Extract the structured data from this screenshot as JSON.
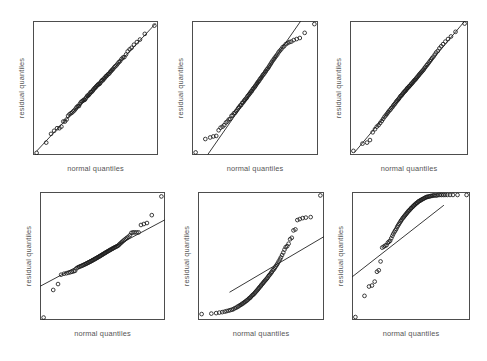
{
  "figure": {
    "width": 487,
    "height": 361,
    "background": "#ffffff",
    "layout": {
      "rows": 2,
      "cols": 3
    },
    "marker_color": "#1c1c1c",
    "line_color": "#222222",
    "frame_color": "#4d4d4d",
    "label_color": "#555555"
  },
  "chart_data": [
    {
      "type": "scatter",
      "panel_index": 1,
      "panel_label": "top-left",
      "title": "",
      "xlabel": "normal quantiles",
      "ylabel": "residual quantiles",
      "grid": false,
      "legend": "none",
      "xlim": [
        -2.6,
        2.6
      ],
      "ylim": [
        -2.6,
        2.6
      ],
      "reference_line": {
        "slope": 1.0,
        "intercept": 0.0,
        "x_from": -2.45,
        "x_to": 2.5,
        "description": "straight diagonal reference line from lower-left to upper-right"
      },
      "annotation": "well-behaved normal Q-Q plot: points follow the reference line closely",
      "x": [
        -2.45,
        -2.05,
        -1.85,
        -1.72,
        -1.6,
        -1.5,
        -1.42,
        -1.34,
        -1.27,
        -1.2,
        -1.14,
        -1.08,
        -1.02,
        -0.97,
        -0.92,
        -0.87,
        -0.82,
        -0.78,
        -0.73,
        -0.69,
        -0.65,
        -0.61,
        -0.57,
        -0.53,
        -0.49,
        -0.45,
        -0.42,
        -0.38,
        -0.34,
        -0.31,
        -0.27,
        -0.24,
        -0.2,
        -0.17,
        -0.13,
        -0.1,
        -0.07,
        -0.03,
        0.0,
        0.03,
        0.07,
        0.1,
        0.13,
        0.17,
        0.2,
        0.24,
        0.27,
        0.31,
        0.34,
        0.38,
        0.42,
        0.45,
        0.49,
        0.53,
        0.57,
        0.61,
        0.65,
        0.69,
        0.73,
        0.78,
        0.82,
        0.87,
        0.92,
        0.97,
        1.02,
        1.08,
        1.14,
        1.2,
        1.27,
        1.34,
        1.42,
        1.5,
        1.6,
        1.72,
        1.85,
        2.05,
        2.45
      ],
      "y": [
        -2.52,
        -2.12,
        -1.78,
        -1.66,
        -1.56,
        -1.56,
        -1.5,
        -1.3,
        -1.3,
        -1.22,
        -1.08,
        -1.02,
        -0.98,
        -0.95,
        -0.9,
        -0.86,
        -0.8,
        -0.74,
        -0.7,
        -0.7,
        -0.62,
        -0.56,
        -0.52,
        -0.5,
        -0.46,
        -0.46,
        -0.42,
        -0.36,
        -0.3,
        -0.3,
        -0.26,
        -0.22,
        -0.16,
        -0.16,
        -0.12,
        -0.08,
        -0.04,
        0.0,
        0.02,
        0.06,
        0.1,
        0.12,
        0.16,
        0.16,
        0.2,
        0.26,
        0.3,
        0.3,
        0.36,
        0.38,
        0.44,
        0.46,
        0.5,
        0.54,
        0.56,
        0.62,
        0.66,
        0.7,
        0.74,
        0.8,
        0.84,
        0.88,
        0.94,
        1.0,
        1.04,
        1.12,
        1.18,
        1.2,
        1.3,
        1.42,
        1.5,
        1.56,
        1.68,
        1.78,
        1.88,
        2.1,
        2.42
      ]
    },
    {
      "type": "scatter",
      "panel_index": 2,
      "panel_label": "top-middle",
      "title": "",
      "xlabel": "normal quantiles",
      "ylabel": "residual quantiles",
      "grid": false,
      "legend": "none",
      "xlim": [
        -2.6,
        2.6
      ],
      "ylim": [
        -2.6,
        2.6
      ],
      "reference_line": {
        "slope": 1.35,
        "intercept": 0.05,
        "x_from": -1.95,
        "x_to": 1.9,
        "description": "steeper reference line exiting through the top edge of the frame"
      },
      "annotation": "approximately normal; the steeper reference line leaves the panel at the top",
      "x": [
        -2.45,
        -2.05,
        -1.85,
        -1.72,
        -1.6,
        -1.5,
        -1.42,
        -1.34,
        -1.27,
        -1.2,
        -1.14,
        -1.08,
        -1.02,
        -0.97,
        -0.92,
        -0.87,
        -0.82,
        -0.78,
        -0.73,
        -0.69,
        -0.65,
        -0.61,
        -0.57,
        -0.53,
        -0.49,
        -0.45,
        -0.42,
        -0.38,
        -0.34,
        -0.31,
        -0.27,
        -0.24,
        -0.2,
        -0.17,
        -0.13,
        -0.1,
        -0.07,
        -0.03,
        0.0,
        0.03,
        0.07,
        0.1,
        0.13,
        0.17,
        0.2,
        0.24,
        0.27,
        0.31,
        0.34,
        0.38,
        0.42,
        0.45,
        0.49,
        0.53,
        0.57,
        0.61,
        0.65,
        0.69,
        0.73,
        0.78,
        0.82,
        0.87,
        0.92,
        0.97,
        1.02,
        1.08,
        1.14,
        1.2,
        1.27,
        1.34,
        1.42,
        1.5,
        1.6,
        1.72,
        1.85,
        2.05,
        2.45
      ],
      "y": [
        -2.5,
        -1.98,
        -1.92,
        -1.88,
        -1.86,
        -1.64,
        -1.54,
        -1.5,
        -1.44,
        -1.34,
        -1.3,
        -1.22,
        -1.2,
        -1.08,
        -1.06,
        -0.98,
        -0.96,
        -0.9,
        -0.84,
        -0.78,
        -0.74,
        -0.68,
        -0.66,
        -0.58,
        -0.56,
        -0.5,
        -0.46,
        -0.42,
        -0.38,
        -0.32,
        -0.28,
        -0.24,
        -0.2,
        -0.14,
        -0.12,
        -0.06,
        -0.02,
        0.02,
        0.06,
        0.1,
        0.16,
        0.2,
        0.24,
        0.28,
        0.34,
        0.38,
        0.42,
        0.48,
        0.52,
        0.56,
        0.62,
        0.66,
        0.72,
        0.76,
        0.82,
        0.88,
        0.94,
        1.0,
        1.06,
        1.12,
        1.18,
        1.24,
        1.3,
        1.38,
        1.44,
        1.5,
        1.58,
        1.62,
        1.7,
        1.74,
        1.78,
        1.8,
        1.86,
        1.9,
        1.94,
        2.14,
        2.48
      ]
    },
    {
      "type": "scatter",
      "panel_index": 3,
      "panel_label": "top-right",
      "title": "",
      "xlabel": "normal quantiles",
      "ylabel": "residual quantiles",
      "grid": false,
      "legend": "none",
      "xlim": [
        -2.6,
        2.6
      ],
      "ylim": [
        -2.6,
        2.6
      ],
      "reference_line": {
        "slope": 1.05,
        "intercept": 0.02,
        "x_from": -2.4,
        "x_to": 2.45,
        "description": "straight diagonal reference line from lower-left to upper-right"
      },
      "annotation": "well-behaved normal Q-Q plot: points follow the reference line closely",
      "x": [
        -2.45,
        -2.05,
        -1.85,
        -1.72,
        -1.6,
        -1.5,
        -1.42,
        -1.34,
        -1.27,
        -1.2,
        -1.14,
        -1.08,
        -1.02,
        -0.97,
        -0.92,
        -0.87,
        -0.82,
        -0.78,
        -0.73,
        -0.69,
        -0.65,
        -0.61,
        -0.57,
        -0.53,
        -0.49,
        -0.45,
        -0.42,
        -0.38,
        -0.34,
        -0.31,
        -0.27,
        -0.24,
        -0.2,
        -0.17,
        -0.13,
        -0.1,
        -0.07,
        -0.03,
        0.0,
        0.03,
        0.07,
        0.1,
        0.13,
        0.17,
        0.2,
        0.24,
        0.27,
        0.31,
        0.34,
        0.38,
        0.42,
        0.45,
        0.49,
        0.53,
        0.57,
        0.61,
        0.65,
        0.69,
        0.73,
        0.78,
        0.82,
        0.87,
        0.92,
        0.97,
        1.02,
        1.08,
        1.14,
        1.2,
        1.27,
        1.34,
        1.42,
        1.5,
        1.6,
        1.72,
        1.85,
        2.05,
        2.45
      ],
      "y": [
        -2.44,
        -2.16,
        -2.12,
        -2.02,
        -1.72,
        -1.6,
        -1.5,
        -1.44,
        -1.36,
        -1.28,
        -1.2,
        -1.12,
        -1.06,
        -1.0,
        -0.94,
        -0.88,
        -0.84,
        -0.78,
        -0.74,
        -0.68,
        -0.64,
        -0.6,
        -0.54,
        -0.5,
        -0.46,
        -0.42,
        -0.38,
        -0.32,
        -0.3,
        -0.26,
        -0.22,
        -0.18,
        -0.14,
        -0.12,
        -0.08,
        -0.04,
        0.0,
        0.02,
        0.06,
        0.08,
        0.12,
        0.16,
        0.18,
        0.22,
        0.26,
        0.3,
        0.32,
        0.36,
        0.4,
        0.44,
        0.48,
        0.52,
        0.56,
        0.6,
        0.64,
        0.68,
        0.72,
        0.78,
        0.82,
        0.88,
        0.92,
        0.98,
        1.04,
        1.1,
        1.16,
        1.22,
        1.3,
        1.38,
        1.44,
        1.54,
        1.62,
        1.7,
        1.8,
        1.9,
        2.0,
        2.18,
        2.5
      ]
    },
    {
      "type": "scatter",
      "panel_index": 4,
      "panel_label": "bottom-left",
      "title": "",
      "xlabel": "normal quantiles",
      "ylabel": "residual quantiles",
      "grid": false,
      "legend": "none",
      "xlim": [
        -2.6,
        2.6
      ],
      "ylim": [
        -2.6,
        2.6
      ],
      "reference_line": {
        "slope": 0.52,
        "intercept": 0.12,
        "x_from": -2.6,
        "x_to": 2.6,
        "description": "shallow reference line crossing the left and right frame edges"
      },
      "annotation": "heavy-tailed / outlier pattern: extreme points fall far from the shallow reference line at both ends",
      "x": [
        -2.45,
        -2.05,
        -1.85,
        -1.72,
        -1.6,
        -1.5,
        -1.42,
        -1.34,
        -1.27,
        -1.2,
        -1.14,
        -1.08,
        -1.02,
        -0.97,
        -0.92,
        -0.87,
        -0.82,
        -0.78,
        -0.73,
        -0.69,
        -0.65,
        -0.61,
        -0.57,
        -0.53,
        -0.49,
        -0.45,
        -0.42,
        -0.38,
        -0.34,
        -0.31,
        -0.27,
        -0.24,
        -0.2,
        -0.17,
        -0.13,
        -0.1,
        -0.07,
        -0.03,
        0.0,
        0.03,
        0.07,
        0.1,
        0.13,
        0.17,
        0.2,
        0.24,
        0.27,
        0.31,
        0.34,
        0.38,
        0.42,
        0.45,
        0.49,
        0.53,
        0.57,
        0.61,
        0.65,
        0.69,
        0.73,
        0.78,
        0.82,
        0.87,
        0.92,
        0.97,
        1.02,
        1.08,
        1.14,
        1.2,
        1.27,
        1.34,
        1.42,
        1.5,
        1.6,
        1.72,
        1.85,
        2.05,
        2.45
      ],
      "y": [
        -2.5,
        -1.38,
        -1.14,
        -0.76,
        -0.72,
        -0.7,
        -0.68,
        -0.66,
        -0.64,
        -0.62,
        -0.6,
        -0.5,
        -0.46,
        -0.44,
        -0.42,
        -0.4,
        -0.38,
        -0.36,
        -0.34,
        -0.32,
        -0.3,
        -0.28,
        -0.26,
        -0.24,
        -0.22,
        -0.2,
        -0.18,
        -0.16,
        -0.14,
        -0.12,
        -0.1,
        -0.08,
        -0.06,
        -0.04,
        -0.02,
        0.0,
        0.02,
        0.04,
        0.06,
        0.08,
        0.1,
        0.12,
        0.14,
        0.16,
        0.18,
        0.2,
        0.22,
        0.24,
        0.26,
        0.28,
        0.3,
        0.32,
        0.34,
        0.36,
        0.38,
        0.4,
        0.42,
        0.46,
        0.5,
        0.54,
        0.58,
        0.62,
        0.66,
        0.7,
        0.74,
        0.78,
        0.84,
        0.94,
        0.96,
        0.96,
        0.96,
        0.96,
        1.26,
        1.3,
        1.34,
        1.66,
        2.42
      ]
    },
    {
      "type": "scatter",
      "panel_index": 5,
      "panel_label": "bottom-middle",
      "title": "",
      "xlabel": "normal quantiles",
      "ylabel": "residual quantiles",
      "grid": false,
      "legend": "none",
      "xlim": [
        -2.6,
        2.6
      ],
      "ylim": [
        -2.6,
        2.6
      ],
      "reference_line": {
        "slope": 0.58,
        "intercept": -0.72,
        "x_from": -1.3,
        "x_to": 2.6,
        "description": "reference line rising from the bottom-left area to the right frame edge"
      },
      "annotation": "right-skewed residuals: convex curve with points accelerating above the reference line in the upper tail",
      "x": [
        -2.45,
        -2.05,
        -1.85,
        -1.72,
        -1.6,
        -1.5,
        -1.42,
        -1.34,
        -1.27,
        -1.2,
        -1.14,
        -1.08,
        -1.02,
        -0.97,
        -0.92,
        -0.87,
        -0.82,
        -0.78,
        -0.73,
        -0.69,
        -0.65,
        -0.61,
        -0.57,
        -0.53,
        -0.49,
        -0.45,
        -0.42,
        -0.38,
        -0.34,
        -0.31,
        -0.27,
        -0.24,
        -0.2,
        -0.17,
        -0.13,
        -0.1,
        -0.07,
        -0.03,
        0.0,
        0.03,
        0.07,
        0.1,
        0.13,
        0.17,
        0.2,
        0.24,
        0.27,
        0.31,
        0.34,
        0.38,
        0.42,
        0.45,
        0.49,
        0.53,
        0.57,
        0.61,
        0.65,
        0.69,
        0.73,
        0.78,
        0.82,
        0.87,
        0.92,
        0.97,
        1.02,
        1.08,
        1.14,
        1.2,
        1.27,
        1.34,
        1.42,
        1.5,
        1.6,
        1.72,
        1.85,
        2.05,
        2.45
      ],
      "y": [
        -2.36,
        -2.34,
        -2.32,
        -2.3,
        -2.28,
        -2.26,
        -2.24,
        -2.22,
        -2.2,
        -2.18,
        -2.16,
        -2.12,
        -2.1,
        -2.06,
        -2.04,
        -2.0,
        -1.98,
        -1.94,
        -1.92,
        -1.88,
        -1.86,
        -1.82,
        -1.8,
        -1.76,
        -1.72,
        -1.7,
        -1.66,
        -1.62,
        -1.58,
        -1.56,
        -1.52,
        -1.48,
        -1.44,
        -1.4,
        -1.36,
        -1.32,
        -1.28,
        -1.24,
        -1.2,
        -1.16,
        -1.12,
        -1.08,
        -1.04,
        -1.0,
        -0.96,
        -0.92,
        -0.88,
        -0.82,
        -0.78,
        -0.74,
        -0.68,
        -0.64,
        -0.58,
        -0.54,
        -0.48,
        -0.42,
        -0.36,
        -0.3,
        -0.22,
        -0.14,
        -0.06,
        0.04,
        0.14,
        0.26,
        0.36,
        0.4,
        0.5,
        0.68,
        0.74,
        1.04,
        1.08,
        1.46,
        1.5,
        1.54,
        1.56,
        1.58,
        2.46
      ]
    },
    {
      "type": "scatter",
      "panel_index": 6,
      "panel_label": "bottom-right",
      "title": "",
      "xlabel": "normal quantiles",
      "ylabel": "residual quantiles",
      "grid": false,
      "legend": "none",
      "xlim": [
        -2.6,
        2.6
      ],
      "ylim": [
        -2.6,
        2.6
      ],
      "reference_line": {
        "slope": 0.72,
        "intercept": 1.02,
        "x_from": -2.6,
        "x_to": 1.45,
        "description": "reference line entering at the left frame edge and exiting near the top"
      },
      "annotation": "left-skewed residuals: concave curve with points dropping far below the reference line in the lower tail",
      "x": [
        -2.45,
        -2.05,
        -1.85,
        -1.72,
        -1.6,
        -1.5,
        -1.42,
        -1.34,
        -1.27,
        -1.2,
        -1.14,
        -1.08,
        -1.02,
        -0.97,
        -0.92,
        -0.87,
        -0.82,
        -0.78,
        -0.73,
        -0.69,
        -0.65,
        -0.61,
        -0.57,
        -0.53,
        -0.49,
        -0.45,
        -0.42,
        -0.38,
        -0.34,
        -0.31,
        -0.27,
        -0.24,
        -0.2,
        -0.17,
        -0.13,
        -0.1,
        -0.07,
        -0.03,
        0.0,
        0.03,
        0.07,
        0.1,
        0.13,
        0.17,
        0.2,
        0.24,
        0.27,
        0.31,
        0.34,
        0.38,
        0.42,
        0.45,
        0.49,
        0.53,
        0.57,
        0.61,
        0.65,
        0.69,
        0.73,
        0.78,
        0.82,
        0.87,
        0.92,
        0.97,
        1.02,
        1.08,
        1.14,
        1.2,
        1.27,
        1.34,
        1.42,
        1.5,
        1.6,
        1.72,
        1.85,
        2.05,
        2.45
      ],
      "y": [
        -2.48,
        -1.62,
        -1.24,
        -1.2,
        -1.04,
        -0.64,
        -0.58,
        -0.22,
        0.34,
        0.38,
        0.42,
        0.44,
        0.54,
        0.58,
        0.62,
        0.72,
        0.82,
        0.9,
        0.98,
        1.04,
        1.1,
        1.18,
        1.24,
        1.3,
        1.36,
        1.42,
        1.46,
        1.52,
        1.56,
        1.6,
        1.64,
        1.68,
        1.72,
        1.76,
        1.8,
        1.84,
        1.86,
        1.9,
        1.94,
        1.96,
        2.0,
        2.02,
        2.06,
        2.08,
        2.12,
        2.14,
        2.16,
        2.2,
        2.22,
        2.24,
        2.26,
        2.28,
        2.3,
        2.32,
        2.34,
        2.36,
        2.38,
        2.4,
        2.4,
        2.42,
        2.42,
        2.44,
        2.44,
        2.46,
        2.46,
        2.46,
        2.46,
        2.48,
        2.48,
        2.48,
        2.48,
        2.48,
        2.48,
        2.48,
        2.48,
        2.48,
        2.48
      ]
    }
  ]
}
